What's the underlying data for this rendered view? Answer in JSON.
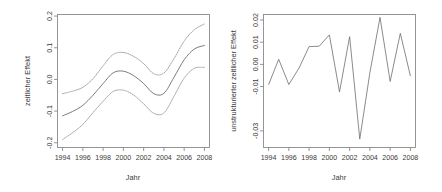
{
  "figure": {
    "background_color": "#ffffff",
    "line_color": "#6d6d6d",
    "band_color": "#9a9a9a",
    "axis_color": "#8a8a8a"
  },
  "chart_data": [
    {
      "type": "line",
      "panel": "left",
      "title": "",
      "xlabel": "Jahr",
      "ylabel": "zeitlicher Effekt",
      "xlim": [
        1993.5,
        2008.5
      ],
      "ylim": [
        -0.215,
        0.205
      ],
      "grid": false,
      "legend": "none",
      "xticks": [
        1994,
        1996,
        1998,
        2000,
        2002,
        2004,
        2006,
        2008
      ],
      "xticklabels": [
        "1994",
        "1996",
        "1998",
        "2000",
        "2002",
        "2004",
        "2006",
        "2008"
      ],
      "yticks": [
        -0.2,
        -0.1,
        0.0,
        0.1,
        0.2
      ],
      "yticklabels": [
        "-0.2",
        "-0.1",
        "0.0",
        "0.1",
        "0.2"
      ],
      "x": [
        1994,
        1995,
        1996,
        1997,
        1998,
        1999,
        2000,
        2001,
        2002,
        2003,
        2004,
        2005,
        2006,
        2007,
        2008
      ],
      "series": [
        {
          "name": "zeitlicher Effekt (Schätzung)",
          "style": "solid",
          "values": [
            -0.115,
            -0.101,
            -0.082,
            -0.05,
            -0.013,
            0.021,
            0.026,
            0.012,
            -0.013,
            -0.045,
            -0.044,
            0.007,
            0.062,
            0.096,
            0.107
          ]
        },
        {
          "name": "oberes Konfidenzband",
          "style": "dotted",
          "values": [
            -0.045,
            -0.037,
            -0.025,
            0.002,
            0.043,
            0.079,
            0.085,
            0.073,
            0.05,
            0.018,
            0.02,
            0.066,
            0.121,
            0.157,
            0.175
          ]
        },
        {
          "name": "unteres Konfidenzband",
          "style": "dotted",
          "values": [
            -0.19,
            -0.168,
            -0.142,
            -0.105,
            -0.069,
            -0.038,
            -0.034,
            -0.049,
            -0.077,
            -0.107,
            -0.106,
            -0.053,
            0.004,
            0.035,
            0.038
          ]
        }
      ]
    },
    {
      "type": "line",
      "panel": "right",
      "title": "",
      "xlabel": "Jahr",
      "ylabel": "unstrukturierter zeitlicher Effekt",
      "xlim": [
        1993.5,
        2008.5
      ],
      "ylim": [
        -0.0375,
        0.0225
      ],
      "grid": false,
      "legend": "none",
      "xticks": [
        1994,
        1996,
        1998,
        2000,
        2002,
        2004,
        2006,
        2008
      ],
      "xticklabels": [
        "1994",
        "1996",
        "1998",
        "2000",
        "2002",
        "2004",
        "2006",
        "2008"
      ],
      "yticks": [
        -0.03,
        -0.01,
        0.0,
        0.01,
        0.02
      ],
      "yticklabels": [
        "-0.03",
        "-0.01",
        "0.00",
        "0.01",
        "0.02"
      ],
      "x": [
        1994,
        1995,
        1996,
        1997,
        1998,
        1999,
        2000,
        2001,
        2002,
        2003,
        2004,
        2005,
        2006,
        2007,
        2008
      ],
      "series": [
        {
          "name": "unstrukturierter zeitlicher Effekt",
          "style": "solid",
          "values": [
            -0.0092,
            0.0023,
            -0.0091,
            -0.0017,
            0.008,
            0.0082,
            0.0133,
            -0.0124,
            0.0125,
            -0.0337,
            -0.0037,
            0.0212,
            -0.0077,
            0.014,
            -0.0053
          ]
        }
      ]
    }
  ]
}
